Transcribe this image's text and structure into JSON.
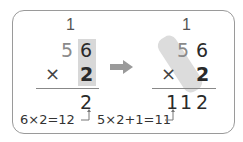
{
  "left": {
    "carry": "1",
    "top_digits": [
      "5",
      "6"
    ],
    "operator": "×",
    "multiplier": "2",
    "result": "2",
    "note": "6×2=12"
  },
  "right": {
    "carry": "1",
    "top_digits": [
      "5",
      "6"
    ],
    "operator": "×",
    "multiplier": "2",
    "result": [
      "1",
      "1",
      "2"
    ],
    "note": "5×2+1=11"
  },
  "arrow": "right-arrow",
  "colors": {
    "highlight": "#d8d8d8",
    "arrow": "#9a9a9a",
    "border": "#9a9a9a",
    "text": "#2a2a2a"
  }
}
